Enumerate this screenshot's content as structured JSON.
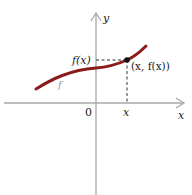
{
  "diagram": {
    "axes": {
      "x_label": "x",
      "y_label": "y",
      "origin_label": "0",
      "axis_color": "#a8a8a8"
    },
    "curve": {
      "label": "f",
      "color": "#8b1a1a",
      "label_color": "#9a9a9a"
    },
    "point": {
      "label": "(x, f(x))",
      "color": "#111111"
    },
    "ticks": {
      "y_tick_label": "f(x)",
      "x_tick_label": "x"
    },
    "guide_line_style": "dashed"
  }
}
